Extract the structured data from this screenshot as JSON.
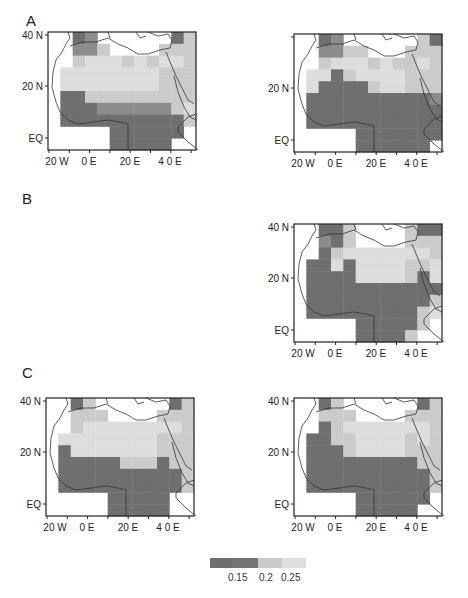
{
  "chart_data": {
    "type": "heatmap",
    "title": "",
    "legend": {
      "type": "colorbar",
      "position": "bottom-center",
      "colors": [
        "#6e6e6e",
        "#7c7c7c",
        "#c9c9c9",
        "#dedede"
      ],
      "tick_labels": [
        "0.15",
        "0.2",
        "0.25"
      ],
      "class_codes": {
        "0": "no data",
        "1": "< 0.15 (darkest)",
        "2": "0.15-0.2",
        "3": "0.2-0.25",
        "4": "> 0.25 (lightest)"
      }
    },
    "axes": {
      "y_ticks": [
        "40 N",
        "20 N",
        "EQ"
      ],
      "x_ticks": [
        "20 W",
        "0 E",
        "20 E",
        "4 0 E"
      ],
      "lon_range": [
        -25,
        52
      ],
      "lat_range": [
        -5,
        40
      ],
      "grid": false
    },
    "grid_cols": 12,
    "grid_rows": 10,
    "panels": [
      {
        "group": "A",
        "position": "left",
        "show_ylabels": [
          "40 N",
          "20 N",
          "EQ"
        ],
        "cells": [
          [
            0,
            0,
            1,
            2,
            0,
            0,
            0,
            0,
            0,
            0,
            1,
            3
          ],
          [
            0,
            0,
            2,
            2,
            3,
            0,
            0,
            0,
            0,
            3,
            3,
            3
          ],
          [
            0,
            0,
            3,
            4,
            4,
            4,
            3,
            4,
            3,
            4,
            4,
            3
          ],
          [
            0,
            4,
            4,
            4,
            4,
            4,
            4,
            4,
            4,
            3,
            3,
            3
          ],
          [
            0,
            4,
            4,
            4,
            4,
            4,
            4,
            4,
            4,
            3,
            3,
            3
          ],
          [
            0,
            1,
            1,
            3,
            3,
            3,
            3,
            3,
            3,
            3,
            3,
            3
          ],
          [
            0,
            1,
            1,
            1,
            2,
            2,
            2,
            2,
            2,
            2,
            3,
            4
          ],
          [
            0,
            1,
            1,
            1,
            1,
            1,
            1,
            1,
            1,
            1,
            1,
            3
          ],
          [
            0,
            0,
            0,
            0,
            0,
            1,
            1,
            1,
            1,
            1,
            1,
            0
          ],
          [
            0,
            0,
            0,
            0,
            0,
            1,
            1,
            1,
            1,
            1,
            0,
            0
          ]
        ]
      },
      {
        "group": "A",
        "position": "right",
        "show_ylabels": [
          "20 N",
          "EQ"
        ],
        "cells": [
          [
            0,
            0,
            1,
            2,
            0,
            0,
            0,
            0,
            0,
            0,
            3,
            1
          ],
          [
            0,
            0,
            2,
            2,
            3,
            3,
            0,
            0,
            0,
            3,
            3,
            3
          ],
          [
            0,
            0,
            3,
            4,
            4,
            4,
            3,
            4,
            3,
            3,
            4,
            3
          ],
          [
            0,
            4,
            4,
            1,
            3,
            4,
            4,
            4,
            4,
            3,
            3,
            3
          ],
          [
            0,
            4,
            1,
            1,
            1,
            1,
            3,
            4,
            4,
            3,
            3,
            3
          ],
          [
            0,
            1,
            1,
            1,
            1,
            1,
            1,
            1,
            1,
            1,
            1,
            2
          ],
          [
            0,
            1,
            1,
            1,
            1,
            1,
            1,
            1,
            1,
            1,
            1,
            1
          ],
          [
            0,
            1,
            1,
            1,
            1,
            1,
            1,
            1,
            1,
            1,
            1,
            1
          ],
          [
            0,
            0,
            0,
            0,
            0,
            1,
            1,
            1,
            1,
            1,
            1,
            1
          ],
          [
            0,
            0,
            0,
            0,
            0,
            1,
            1,
            1,
            1,
            1,
            1,
            0
          ]
        ]
      },
      {
        "group": "B",
        "position": "right",
        "show_ylabels": [
          "40 N",
          "20 N",
          "EQ"
        ],
        "cells": [
          [
            0,
            0,
            1,
            1,
            3,
            0,
            0,
            0,
            0,
            3,
            1,
            1
          ],
          [
            0,
            0,
            2,
            1,
            3,
            0,
            0,
            0,
            0,
            3,
            3,
            3
          ],
          [
            0,
            0,
            1,
            3,
            4,
            4,
            4,
            4,
            4,
            4,
            4,
            3
          ],
          [
            0,
            1,
            1,
            4,
            1,
            4,
            4,
            4,
            4,
            3,
            3,
            4
          ],
          [
            0,
            1,
            1,
            1,
            1,
            4,
            4,
            4,
            4,
            3,
            1,
            4
          ],
          [
            0,
            1,
            1,
            1,
            1,
            1,
            1,
            1,
            1,
            1,
            1,
            1
          ],
          [
            0,
            1,
            1,
            1,
            1,
            1,
            1,
            1,
            1,
            1,
            1,
            3
          ],
          [
            0,
            1,
            1,
            1,
            1,
            1,
            1,
            1,
            1,
            1,
            3,
            4
          ],
          [
            0,
            0,
            0,
            0,
            0,
            1,
            1,
            1,
            1,
            1,
            3,
            0
          ],
          [
            0,
            0,
            0,
            0,
            0,
            1,
            1,
            1,
            1,
            3,
            0,
            0
          ]
        ]
      },
      {
        "group": "C",
        "position": "left",
        "show_ylabels": [
          "40 N",
          "20 N",
          "EQ"
        ],
        "cells": [
          [
            0,
            0,
            1,
            3,
            0,
            0,
            0,
            0,
            0,
            0,
            1,
            3
          ],
          [
            0,
            0,
            3,
            3,
            3,
            0,
            0,
            0,
            0,
            3,
            3,
            3
          ],
          [
            0,
            0,
            3,
            4,
            4,
            4,
            4,
            4,
            4,
            4,
            4,
            3
          ],
          [
            0,
            4,
            4,
            4,
            4,
            4,
            4,
            4,
            4,
            3,
            3,
            3
          ],
          [
            0,
            1,
            4,
            4,
            4,
            4,
            4,
            4,
            4,
            3,
            3,
            3
          ],
          [
            0,
            1,
            1,
            1,
            1,
            1,
            3,
            3,
            3,
            1,
            3,
            3
          ],
          [
            0,
            1,
            1,
            1,
            1,
            1,
            1,
            1,
            1,
            1,
            1,
            3
          ],
          [
            0,
            1,
            1,
            1,
            1,
            1,
            1,
            1,
            1,
            1,
            1,
            3
          ],
          [
            0,
            0,
            0,
            0,
            0,
            1,
            1,
            1,
            1,
            1,
            0,
            0
          ],
          [
            0,
            0,
            0,
            0,
            0,
            1,
            1,
            1,
            1,
            1,
            0,
            0
          ]
        ]
      },
      {
        "group": "C",
        "position": "right",
        "show_ylabels": [
          "40 N",
          "20 N",
          "EQ"
        ],
        "cells": [
          [
            0,
            0,
            1,
            3,
            0,
            0,
            0,
            0,
            0,
            0,
            1,
            3
          ],
          [
            0,
            0,
            3,
            3,
            3,
            0,
            0,
            0,
            0,
            3,
            3,
            3
          ],
          [
            0,
            0,
            1,
            3,
            4,
            4,
            4,
            4,
            4,
            4,
            4,
            3
          ],
          [
            0,
            1,
            1,
            3,
            3,
            4,
            4,
            4,
            4,
            3,
            4,
            3
          ],
          [
            0,
            1,
            1,
            1,
            3,
            4,
            4,
            4,
            4,
            3,
            3,
            3
          ],
          [
            0,
            1,
            1,
            1,
            1,
            1,
            1,
            1,
            1,
            1,
            3,
            3
          ],
          [
            0,
            1,
            1,
            1,
            1,
            1,
            1,
            1,
            1,
            1,
            1,
            3
          ],
          [
            0,
            1,
            1,
            1,
            1,
            1,
            1,
            1,
            1,
            1,
            1,
            3
          ],
          [
            0,
            0,
            0,
            0,
            0,
            1,
            1,
            1,
            1,
            1,
            1,
            0
          ],
          [
            0,
            0,
            0,
            0,
            0,
            1,
            1,
            1,
            1,
            1,
            0,
            0
          ]
        ]
      }
    ]
  },
  "figure": {
    "panel_letters": [
      "A",
      "B",
      "C"
    ],
    "colorbar_labels": [
      "0.15",
      "0.2",
      "0.25"
    ]
  }
}
